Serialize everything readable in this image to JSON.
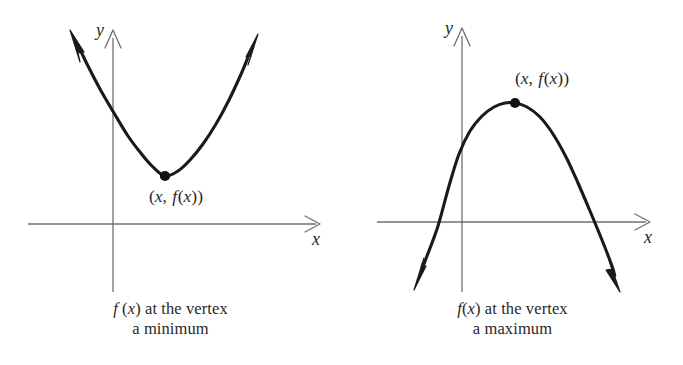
{
  "figure": {
    "background_color": "#ffffff",
    "curve_color": "#1a1a1a",
    "axis_color": "#6f6f6f",
    "text_color": "#2b2724"
  },
  "panels": [
    {
      "id": "minimum",
      "orientation": "opens-up",
      "axis_label_x": "x",
      "axis_label_y": "y",
      "point_label": {
        "open_paren": "(",
        "var_x": "x",
        "comma": ", ",
        "func_f": "f",
        "func_open": "(",
        "func_var": "x",
        "func_close": ")",
        "close_paren": ")",
        "full": "(x, f(x))"
      },
      "caption_line1_prefix": "f",
      "caption_line1_mid": " (",
      "caption_line1_var": "x",
      "caption_line1_rest": ") at the vertex",
      "caption_line2": "a minimum",
      "caption_full": "f (x) at the vertex a minimum"
    },
    {
      "id": "maximum",
      "orientation": "opens-down",
      "axis_label_x": "x",
      "axis_label_y": "y",
      "point_label": {
        "open_paren": "(",
        "var_x": "x",
        "comma": ", ",
        "func_f": "f",
        "func_open": "(",
        "func_var": "x",
        "func_close": ")",
        "close_paren": ")",
        "full": "(x, f(x))"
      },
      "caption_line1_prefix": "f",
      "caption_line1_mid": "(",
      "caption_line1_var": "x",
      "caption_line1_rest": ") at the vertex",
      "caption_line2": "a maximum",
      "caption_full": "f(x) at the vertex a maximum"
    }
  ],
  "chart_data": [
    {
      "type": "line",
      "title": "f (x) at the vertex a minimum",
      "xlabel": "x",
      "ylabel": "y",
      "orientation": "opens-up",
      "grid": false,
      "legend": "none",
      "axes": {
        "origin_px": [
          113,
          224
        ],
        "x_axis_px": [
          28,
          224,
          320,
          224
        ],
        "y_axis_px": [
          113,
          30,
          113,
          292
        ],
        "x_arrow": "right",
        "y_arrow": "up"
      },
      "annotations": [
        {
          "text": "(x, f(x))",
          "target": "vertex",
          "position": "below",
          "anchor_px": [
            175,
            196
          ]
        }
      ],
      "vertex_px": [
        165,
        176
      ],
      "vertex_marker": "filled-circle",
      "curve_px": [
        [
          72,
          32
        ],
        [
          86,
          62
        ],
        [
          100,
          89
        ],
        [
          114,
          113
        ],
        [
          128,
          136
        ],
        [
          140,
          152
        ],
        [
          152,
          166
        ],
        [
          165,
          176
        ],
        [
          178,
          171
        ],
        [
          190,
          160
        ],
        [
          203,
          144
        ],
        [
          216,
          124
        ],
        [
          229,
          100
        ],
        [
          242,
          72
        ],
        [
          255,
          40
        ]
      ],
      "branch_arrows": [
        {
          "tip_px": [
            72,
            32
          ],
          "direction": "up-left",
          "style": "solid-filled"
        },
        {
          "tip_px": [
            255,
            40
          ],
          "direction": "up-right",
          "style": "solid-filled"
        }
      ]
    },
    {
      "type": "line",
      "title": "f(x) at the vertex a maximum",
      "xlabel": "x",
      "ylabel": "y",
      "orientation": "opens-down",
      "grid": false,
      "legend": "none",
      "axes": {
        "origin_px": [
          462,
          222
        ],
        "x_axis_px": [
          377,
          222,
          650,
          222
        ],
        "y_axis_px": [
          462,
          28,
          462,
          292
        ],
        "x_arrow": "right",
        "y_arrow": "up"
      },
      "annotations": [
        {
          "text": "(x, f(x))",
          "target": "vertex",
          "position": "above",
          "anchor_px": [
            540,
            82
          ]
        }
      ],
      "vertex_px": [
        515,
        103
      ],
      "vertex_marker": "filled-circle",
      "curve_px": [
        [
          416,
          285
        ],
        [
          427,
          256
        ],
        [
          438,
          226
        ],
        [
          449,
          186
        ],
        [
          459,
          154
        ],
        [
          470,
          131
        ],
        [
          482,
          116
        ],
        [
          494,
          107
        ],
        [
          505,
          103
        ],
        [
          515,
          103
        ],
        [
          527,
          107
        ],
        [
          540,
          117
        ],
        [
          553,
          134
        ],
        [
          566,
          157
        ],
        [
          578,
          183
        ],
        [
          590,
          211
        ],
        [
          602,
          240
        ],
        [
          612,
          266
        ],
        [
          618,
          287
        ]
      ],
      "branch_arrows": [
        {
          "tip_px": [
            416,
            285
          ],
          "direction": "down-left",
          "style": "solid-filled"
        },
        {
          "tip_px": [
            618,
            287
          ],
          "direction": "down-right",
          "style": "solid-filled"
        }
      ]
    }
  ]
}
